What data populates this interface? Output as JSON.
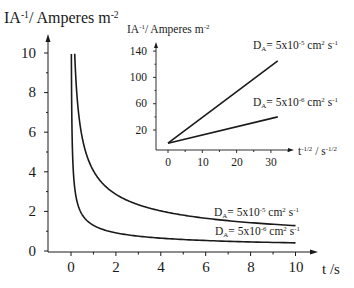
{
  "chart_data": [
    {
      "id": "main",
      "type": "line",
      "title": "",
      "ylabel": {
        "base": "IA",
        "sup1": "-1",
        "mid": "/ Amperes m",
        "sup2": "-2"
      },
      "xlabel": "t /s",
      "x_ticks": [
        "0",
        "2",
        "4",
        "6",
        "8",
        "10"
      ],
      "y_ticks": [
        "0",
        "2",
        "4",
        "6",
        "8",
        "10"
      ],
      "xlim": [
        0,
        10
      ],
      "ylim": [
        0,
        10
      ],
      "grid": false,
      "series": [
        {
          "name": "D_A = 5x10^-5 cm^2 s^-1",
          "label": {
            "pre": "D",
            "sub": "A",
            "mid": "= 5x10",
            "sup": "-5",
            "unit1": " cm",
            "sup2": "2",
            "unit2": " s",
            "sup3": "-1"
          },
          "x": [
            0.165,
            0.2,
            0.3,
            0.5,
            0.75,
            1,
            1.5,
            2,
            3,
            4,
            5,
            6,
            7,
            8,
            9,
            10
          ],
          "values": [
            10.0,
            9.08,
            7.41,
            5.74,
            4.69,
            4.06,
            3.31,
            2.87,
            2.34,
            2.03,
            1.82,
            1.66,
            1.53,
            1.44,
            1.35,
            1.28
          ]
        },
        {
          "name": "D_A = 5x10^-6 cm^2 s^-1",
          "label": {
            "pre": "D",
            "sub": "A",
            "mid": "= 5x10",
            "sup": "-6",
            "unit1": " cm",
            "sup2": "2",
            "unit2": " s",
            "sup3": "-1"
          },
          "x": [
            0.017,
            0.03,
            0.05,
            0.1,
            0.2,
            0.3,
            0.5,
            0.75,
            1,
            1.5,
            2,
            3,
            4,
            5,
            6,
            7,
            8,
            9,
            10
          ],
          "values": [
            10.0,
            7.51,
            5.81,
            4.11,
            2.91,
            2.37,
            1.84,
            1.5,
            1.3,
            1.06,
            0.92,
            0.75,
            0.65,
            0.58,
            0.53,
            0.49,
            0.46,
            0.43,
            0.41
          ]
        }
      ]
    },
    {
      "id": "inset",
      "type": "line",
      "title": "",
      "ylabel": {
        "base": "IA",
        "sup1": "-1",
        "mid": "/ Amperes m",
        "sup2": "-2"
      },
      "xlabel": {
        "base": "t",
        "sup1": "-1/2",
        "mid": " / s",
        "sup2": "-1/2"
      },
      "x_ticks": [
        "0",
        "10",
        "20",
        "30"
      ],
      "y_ticks": [
        "20",
        "60",
        "100",
        "140"
      ],
      "xlim": [
        -3,
        36
      ],
      "ylim": [
        -10,
        150
      ],
      "grid": false,
      "series": [
        {
          "name": "D_A = 5x10^-5 cm^2 s^-1",
          "x": [
            0,
            32
          ],
          "values": [
            0,
            125
          ]
        },
        {
          "name": "D_A = 5x10^-6 cm^2 s^-1",
          "x": [
            0,
            32
          ],
          "values": [
            0,
            40
          ]
        }
      ]
    }
  ]
}
